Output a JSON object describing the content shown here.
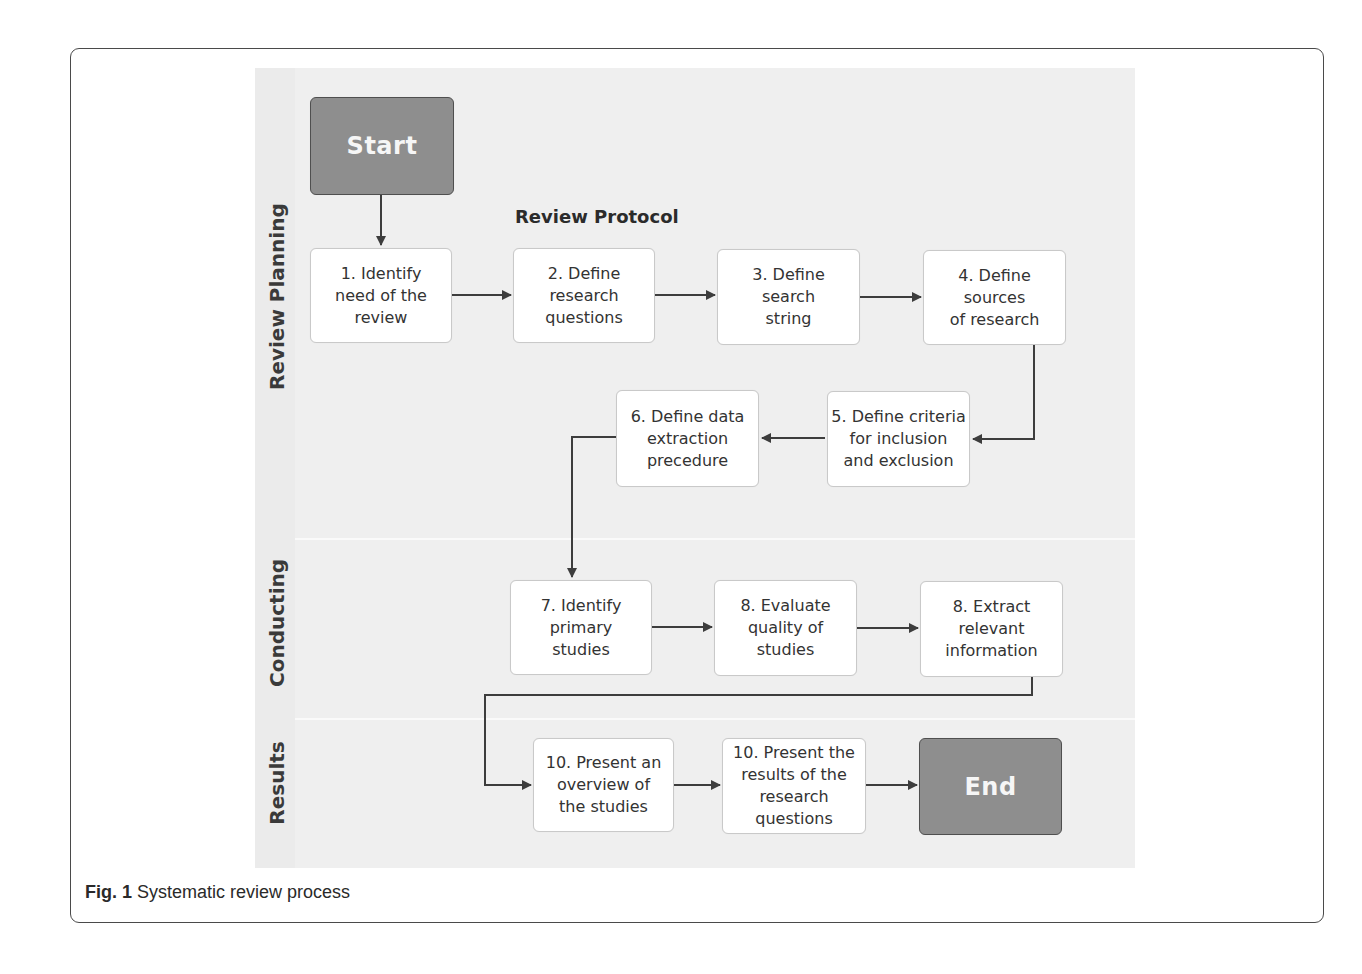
{
  "figure": {
    "caption_label": "Fig. 1",
    "caption_text": " Systematic review process"
  },
  "lanes": [
    {
      "id": "review-planning",
      "label": "Review Planning"
    },
    {
      "id": "conducting",
      "label": "Conducting"
    },
    {
      "id": "results",
      "label": "Results"
    }
  ],
  "section_title": "Review Protocol",
  "nodes": {
    "start": {
      "label": "Start",
      "type": "terminal"
    },
    "n1": {
      "label": "1. Identify\nneed of the\nreview"
    },
    "n2": {
      "label": "2. Define\nresearch\nquestions"
    },
    "n3": {
      "label": "3. Define\nsearch\nstring"
    },
    "n4": {
      "label": "4. Define\nsources\nof research"
    },
    "n5": {
      "label": "5. Define criteria\nfor inclusion\nand exclusion"
    },
    "n6": {
      "label": "6. Define data\nextraction\nprecedure"
    },
    "n7": {
      "label": "7. Identify\nprimary\nstudies"
    },
    "n8a": {
      "label": "8. Evaluate\nquality of\nstudies"
    },
    "n8b": {
      "label": "8. Extract\nrelevant\ninformation"
    },
    "n10a": {
      "label": "10. Present an\noverview of\nthe studies"
    },
    "n10b": {
      "label": "10. Present the\nresults of the\nresearch\nquestions"
    },
    "end": {
      "label": "End",
      "type": "terminal"
    }
  },
  "edges": [
    [
      "start",
      "n1"
    ],
    [
      "n1",
      "n2"
    ],
    [
      "n2",
      "n3"
    ],
    [
      "n3",
      "n4"
    ],
    [
      "n4",
      "n5"
    ],
    [
      "n5",
      "n6"
    ],
    [
      "n6",
      "n7"
    ],
    [
      "n7",
      "n8a"
    ],
    [
      "n8a",
      "n8b"
    ],
    [
      "n8b",
      "n10a"
    ],
    [
      "n10a",
      "n10b"
    ],
    [
      "n10b",
      "end"
    ]
  ],
  "colors": {
    "terminal_fill": "#8e8e8e",
    "terminal_border": "#4f4f4f",
    "box_fill": "#ffffff",
    "box_border": "#c9c9c9",
    "connector": "#3d3d3d",
    "lane_background": "#efefef"
  }
}
